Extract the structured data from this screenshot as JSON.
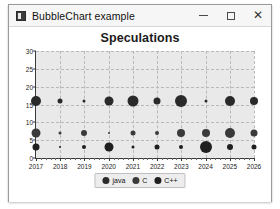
{
  "window": {
    "title": "BubbleChart example",
    "icon": "app-icon",
    "controls": {
      "minimize": "–",
      "maximize": "□",
      "close": "✕"
    }
  },
  "chart_data": {
    "type": "scatter",
    "title": "Speculations",
    "xlabel": "",
    "ylabel": "",
    "xlim": [
      2017,
      2026
    ],
    "ylim": [
      0,
      30
    ],
    "grid": true,
    "legend_position": "bottom",
    "x": [
      2017,
      2018,
      2019,
      2020,
      2021,
      2022,
      2023,
      2024,
      2025,
      2026
    ],
    "xticks": [
      "2017",
      "2018",
      "2019",
      "2020",
      "2021",
      "2022",
      "2023",
      "2024",
      "2025",
      "2026"
    ],
    "yticks": [
      "0",
      "5",
      "10",
      "15",
      "20",
      "25",
      "30"
    ],
    "series": [
      {
        "name": "java",
        "color": "#2a2a2a",
        "values": [
          16,
          16,
          16,
          16,
          16,
          16,
          16,
          16,
          16,
          16
        ],
        "sizes": [
          10,
          5,
          3,
          9,
          11,
          7,
          12,
          3,
          10,
          8
        ]
      },
      {
        "name": "C",
        "color": "#3a3a3a",
        "values": [
          7,
          7,
          7,
          7,
          7,
          7,
          7,
          7,
          7,
          7
        ],
        "sizes": [
          9,
          3,
          6,
          2,
          5,
          4,
          8,
          8,
          10,
          7
        ]
      },
      {
        "name": "C++",
        "color": "#1f1f1f",
        "values": [
          3,
          3,
          3,
          3,
          3,
          3,
          3,
          3,
          3,
          3
        ],
        "sizes": [
          7,
          2,
          4,
          9,
          3,
          5,
          4,
          12,
          6,
          5
        ]
      }
    ]
  },
  "legend": {
    "items": [
      {
        "label": "java",
        "color": "#2a2a2a"
      },
      {
        "label": "C",
        "color": "#3a3a3a"
      },
      {
        "label": "C++",
        "color": "#1f1f1f"
      }
    ]
  }
}
